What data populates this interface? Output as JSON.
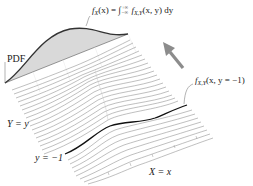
{
  "diagram": {
    "labels": {
      "pdf_axis": "PDF",
      "y_axis": "Y = y",
      "y_slice": "y = −1",
      "x_axis": "X = x"
    },
    "marginal_formula": {
      "lhs_f": "f",
      "lhs_sub": "X",
      "lhs_arg": "(x) = ∫",
      "upper_limit": "+∞",
      "lower_limit": "−∞",
      "rhs_f": " f",
      "rhs_sub": "X,Y",
      "rhs_arg": "(x, y) dy"
    },
    "slice_formula": {
      "f": "f",
      "sub": "X,Y",
      "arg": "(x, y = −1)"
    },
    "colors": {
      "marginal_fill": "#d9d9d9",
      "marginal_line": "#333333",
      "ridge_line": "#8a8a8a",
      "highlight_line": "#111111",
      "arrow": "#8c8c8c"
    },
    "arrow_direction": "up-left (projection toward marginal)"
  }
}
